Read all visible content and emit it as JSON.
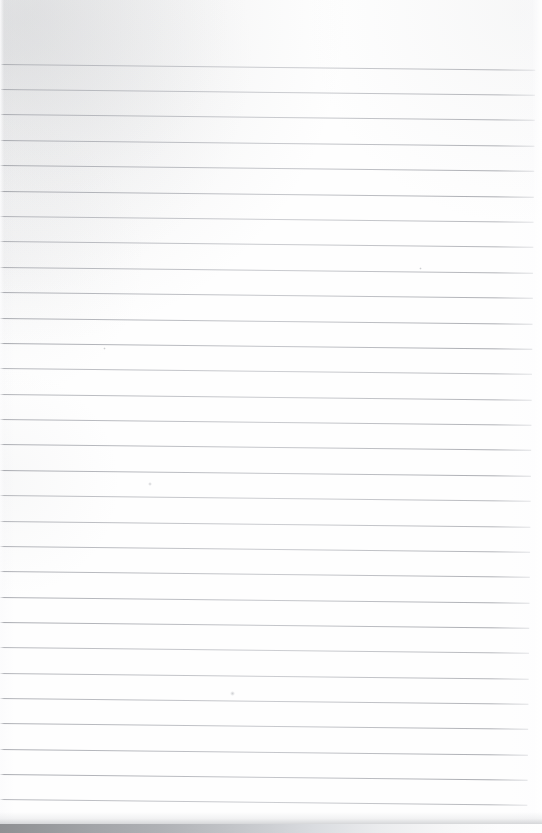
{
  "document": {
    "kind": "scanned-ruled-notebook-page",
    "orientation": "portrait",
    "page_width_px": 542,
    "page_height_px": 833,
    "page_text": "",
    "handwriting_text": "",
    "printed_text": "",
    "is_blank": true,
    "content_note": "Blank lined page — no written or printed text present"
  },
  "colors": {
    "paper": "#fdfdfd",
    "paper_edge_tint": "#fbfbfc",
    "rule_line": "#a8aab0",
    "rule_line_dark": "#96989e",
    "rule_line_light": "#c4c6cb",
    "scan_band_dark": "#8f9093",
    "scan_band_mid": "#b0b2b6",
    "scan_band_light": "#fefefe",
    "artifact_grey": "#a8aaaf"
  },
  "ruling": {
    "style": "wide-ruled-horizontal",
    "line_count": 31,
    "first_line_y": 64,
    "line_spacing_px": 25.4,
    "line_thickness_px": 1,
    "line_start_x": 2,
    "line_end_x": 536,
    "top_margin_px": 62,
    "left_margin_rule": "none",
    "right_margin_rule": "none",
    "skew_degrees": 0.62,
    "lines_y": [
      64,
      89,
      114,
      140,
      165,
      191,
      216,
      241,
      267,
      292,
      318,
      343,
      368,
      394,
      419,
      444,
      470,
      495,
      521,
      546,
      571,
      597,
      622,
      647,
      673,
      698,
      723,
      749,
      774,
      799,
      824
    ]
  },
  "artifacts": {
    "bottom_scan_band": {
      "name": "scanner-edge-shadow",
      "top_y": 824,
      "height_px": 9,
      "fade_direction": "left-dark-to-right-light"
    },
    "specks": [
      {
        "x": 232,
        "y": 693,
        "size": 5
      },
      {
        "x": 150,
        "y": 484,
        "size": 4
      },
      {
        "x": 104,
        "y": 348,
        "size": 3
      },
      {
        "x": 420,
        "y": 268,
        "size": 3
      }
    ],
    "corner_smudge": {
      "name": "top-left-scan-smudge",
      "location": "top-left"
    }
  }
}
